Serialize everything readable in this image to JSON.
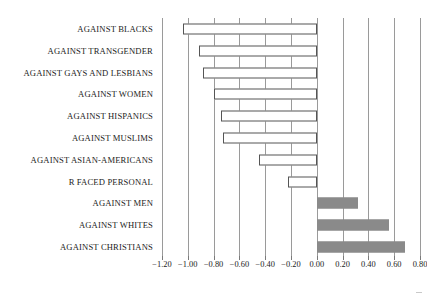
{
  "chart_data": {
    "type": "bar",
    "orientation": "horizontal",
    "title": "",
    "subtitle": "",
    "xlabel": "",
    "ylabel": "",
    "xlim": [
      -1.2,
      0.8
    ],
    "ylim": null,
    "grid": true,
    "legend": null,
    "categories": [
      "AGAINST BLACKS",
      "AGAINST TRANSGENDER",
      "AGAINST GAYS AND LESBIANS",
      "AGAINST WOMEN",
      "AGAINST HISPANICS",
      "AGAINST MUSLIMS",
      "AGAINST ASIAN-AMERICANS",
      "R FACED PERSONAL",
      "AGAINST MEN",
      "AGAINST WHITES",
      "AGAINST CHRISTIANS"
    ],
    "values": [
      -1.04,
      -0.91,
      -0.88,
      -0.8,
      -0.74,
      -0.73,
      -0.45,
      -0.22,
      0.32,
      0.56,
      0.68
    ],
    "bar_styles": [
      "open",
      "open",
      "open",
      "open",
      "open",
      "open",
      "open",
      "open",
      "filled",
      "filled",
      "filled"
    ],
    "xticks": [
      -1.2,
      -1.0,
      -0.8,
      -0.6,
      -0.4,
      -0.2,
      0.0,
      0.2,
      0.4,
      0.6,
      0.8
    ],
    "xticklabels": [
      "−1.20",
      "−1.00",
      "−0.80",
      "−0.60",
      "−0.40",
      "−0.20",
      "0.00",
      "0.20",
      "0.40",
      "0.60",
      "0.80"
    ],
    "colors": {
      "negative_bar_fill": "#ffffff",
      "negative_bar_edge": "#555555",
      "positive_bar_fill": "#8a8a8a",
      "gridline": "#9a9a9a",
      "axis": "#6b6b6b",
      "text": "#1c1c1c",
      "background": "#ffffff"
    }
  }
}
